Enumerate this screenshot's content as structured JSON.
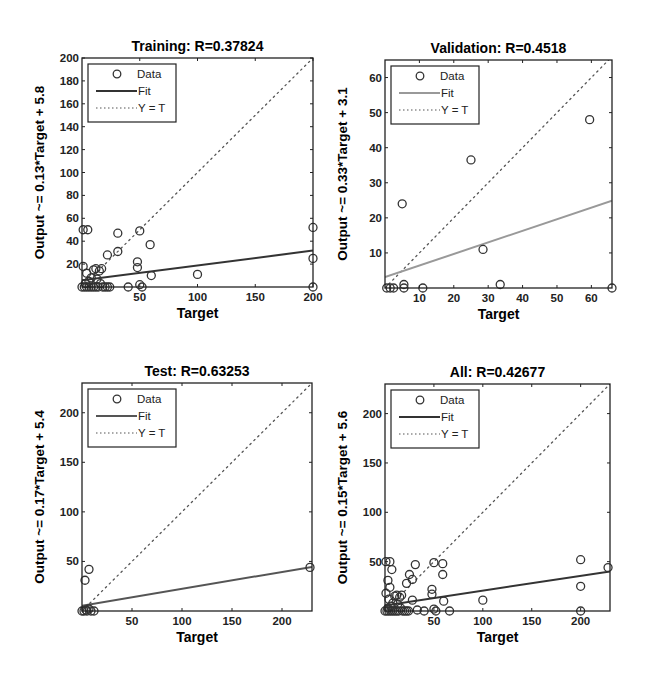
{
  "figure": {
    "background": "#ffffff",
    "colors": {
      "axes": "#222222",
      "data_marker": "#333333",
      "fit_line_dark": "#333333",
      "fit_line_light": "#999999",
      "identity_line": "#555555"
    }
  },
  "chart_data": [
    {
      "type": "scatter",
      "id": "training",
      "title": "Training: R=0.37824",
      "xlabel": "Target",
      "ylabel": "Output ~= 0.13*Target + 5.8",
      "xlim": [
        0,
        200
      ],
      "ylim": [
        0,
        200
      ],
      "xticks": [
        50,
        100,
        150,
        200
      ],
      "yticks": [
        20,
        40,
        60,
        80,
        100,
        120,
        140,
        160,
        180,
        200
      ],
      "grid": false,
      "legend": {
        "position": "upper-left",
        "entries": [
          "Data",
          "Fit",
          "Y = T"
        ]
      },
      "fit": {
        "slope": 0.13,
        "intercept": 5.8,
        "style": "solid",
        "color": "#333333"
      },
      "identity": {
        "style": "dotted"
      },
      "r": 0.37824,
      "points": [
        [
          1,
          50
        ],
        [
          5,
          50
        ],
        [
          31,
          47
        ],
        [
          50,
          49
        ],
        [
          31,
          31
        ],
        [
          22,
          28
        ],
        [
          59,
          37
        ],
        [
          48,
          22
        ],
        [
          48,
          17
        ],
        [
          60,
          10
        ],
        [
          100,
          11
        ],
        [
          200,
          52
        ],
        [
          200,
          25
        ],
        [
          200,
          0
        ],
        [
          40,
          0
        ],
        [
          50,
          2
        ],
        [
          52,
          0
        ],
        [
          1,
          18
        ],
        [
          4,
          12
        ],
        [
          8,
          8
        ],
        [
          10,
          15
        ],
        [
          12,
          16
        ],
        [
          15,
          14
        ],
        [
          17,
          16
        ],
        [
          6,
          5
        ],
        [
          3,
          3
        ],
        [
          13,
          7
        ],
        [
          16,
          3
        ],
        [
          18,
          0
        ],
        [
          20,
          0
        ],
        [
          22,
          0
        ],
        [
          24,
          0
        ],
        [
          0,
          0
        ],
        [
          2,
          0
        ],
        [
          4,
          0
        ],
        [
          6,
          0
        ],
        [
          8,
          0
        ],
        [
          10,
          0
        ],
        [
          12,
          0
        ],
        [
          14,
          0
        ]
      ]
    },
    {
      "type": "scatter",
      "id": "validation",
      "title": "Validation: R=0.4518",
      "xlabel": "Target",
      "ylabel": "Output ~= 0.33*Target + 3.1",
      "xlim": [
        0,
        66
      ],
      "ylim": [
        0,
        65
      ],
      "xticks": [
        10,
        20,
        30,
        40,
        50,
        60
      ],
      "yticks": [
        10,
        20,
        30,
        40,
        50,
        60
      ],
      "grid": false,
      "legend": {
        "position": "upper-left",
        "entries": [
          "Data",
          "Fit",
          "Y = T"
        ]
      },
      "fit": {
        "slope": 0.33,
        "intercept": 3.1,
        "style": "solid",
        "color": "#999999"
      },
      "identity": {
        "style": "dotted"
      },
      "r": 0.4518,
      "points": [
        [
          0.5,
          0
        ],
        [
          1.5,
          0
        ],
        [
          2.5,
          0
        ],
        [
          5,
          24
        ],
        [
          5.5,
          1
        ],
        [
          5.5,
          0
        ],
        [
          11,
          0
        ],
        [
          25,
          36.5
        ],
        [
          28.5,
          11
        ],
        [
          33.5,
          1
        ],
        [
          59.5,
          48
        ],
        [
          66,
          0
        ]
      ]
    },
    {
      "type": "scatter",
      "id": "test",
      "title": "Test: R=0.63253",
      "xlabel": "Target",
      "ylabel": "Output ~= 0.17*Target + 5.4",
      "xlim": [
        0,
        230
      ],
      "ylim": [
        0,
        230
      ],
      "xticks": [
        50,
        100,
        150,
        200
      ],
      "yticks": [
        50,
        100,
        150,
        200
      ],
      "grid": false,
      "legend": {
        "position": "upper-left",
        "entries": [
          "Data",
          "Fit",
          "Y = T"
        ]
      },
      "fit": {
        "slope": 0.17,
        "intercept": 5.4,
        "style": "solid",
        "color": "#555555"
      },
      "identity": {
        "style": "dotted"
      },
      "r": 0.63253,
      "points": [
        [
          3,
          31
        ],
        [
          7,
          42
        ],
        [
          0,
          0
        ],
        [
          2,
          0
        ],
        [
          4,
          1
        ],
        [
          5,
          0
        ],
        [
          7,
          2
        ],
        [
          9,
          0
        ],
        [
          12,
          0
        ],
        [
          228,
          44
        ]
      ]
    },
    {
      "type": "scatter",
      "id": "all",
      "title": "All: R=0.42677",
      "xlabel": "Target",
      "ylabel": "Output ~= 0.15*Target + 5.6",
      "xlim": [
        0,
        230
      ],
      "ylim": [
        0,
        230
      ],
      "xticks": [
        50,
        100,
        150,
        200
      ],
      "yticks": [
        50,
        100,
        150,
        200
      ],
      "grid": false,
      "legend": {
        "position": "upper-left",
        "entries": [
          "Data",
          "Fit",
          "Y = T"
        ]
      },
      "fit": {
        "slope": 0.15,
        "intercept": 5.6,
        "style": "solid",
        "color": "#333333"
      },
      "identity": {
        "style": "dotted"
      },
      "r": 0.42677,
      "points": [
        [
          1,
          50
        ],
        [
          5,
          50
        ],
        [
          7,
          42
        ],
        [
          3,
          31
        ],
        [
          5,
          24
        ],
        [
          31,
          47
        ],
        [
          50,
          49
        ],
        [
          59,
          48
        ],
        [
          59,
          37
        ],
        [
          25,
          37
        ],
        [
          28,
          32
        ],
        [
          22,
          28
        ],
        [
          48,
          22
        ],
        [
          48,
          17
        ],
        [
          60,
          10
        ],
        [
          100,
          11
        ],
        [
          200,
          52
        ],
        [
          200,
          25
        ],
        [
          200,
          0
        ],
        [
          228,
          44
        ],
        [
          28,
          11
        ],
        [
          33,
          1
        ],
        [
          40,
          0
        ],
        [
          50,
          2
        ],
        [
          52,
          0
        ],
        [
          66,
          0
        ],
        [
          1,
          18
        ],
        [
          4,
          12
        ],
        [
          8,
          8
        ],
        [
          10,
          15
        ],
        [
          12,
          16
        ],
        [
          15,
          14
        ],
        [
          17,
          16
        ],
        [
          6,
          5
        ],
        [
          3,
          3
        ],
        [
          13,
          7
        ],
        [
          16,
          3
        ],
        [
          18,
          0
        ],
        [
          20,
          0
        ],
        [
          22,
          0
        ],
        [
          24,
          0
        ],
        [
          0,
          0
        ],
        [
          2,
          0
        ],
        [
          4,
          0
        ],
        [
          6,
          0
        ],
        [
          8,
          0
        ],
        [
          10,
          0
        ],
        [
          12,
          0
        ],
        [
          14,
          0
        ]
      ]
    }
  ],
  "layout": {
    "panels": [
      {
        "box": [
          82,
          58,
          313,
          287
        ]
      },
      {
        "box": [
          385,
          60,
          612,
          288
        ]
      },
      {
        "box": [
          82,
          383,
          312,
          611
        ]
      },
      {
        "box": [
          385,
          384,
          610,
          611
        ]
      }
    ]
  }
}
